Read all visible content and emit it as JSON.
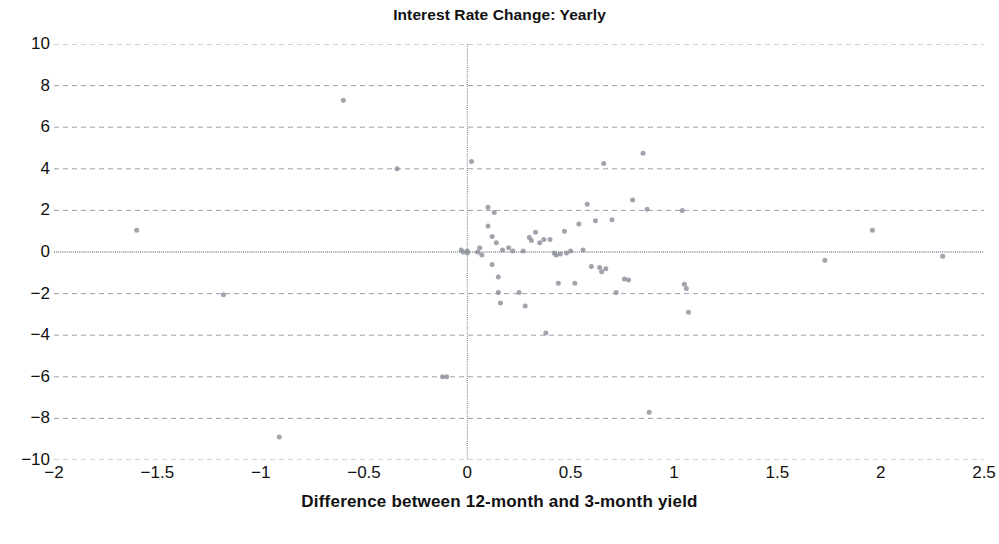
{
  "chart_data": {
    "type": "scatter",
    "title": "Interest Rate Change: Yearly",
    "xlabel": "Difference between 12-month and 3-month yield",
    "ylabel": "",
    "xlim": [
      -2,
      2.5
    ],
    "ylim": [
      -10,
      10
    ],
    "xticks": [
      -2,
      -1.5,
      -1,
      -0.5,
      0,
      0.5,
      1,
      1.5,
      2,
      2.5
    ],
    "xticklabels": [
      "−2",
      "−1.5",
      "−1",
      "−0.5",
      "0",
      "0.5",
      "1",
      "1.5",
      "2",
      "2.5"
    ],
    "yticks": [
      10,
      8,
      6,
      4,
      2,
      0,
      -2,
      -4,
      -6,
      -8,
      -10
    ],
    "yticklabels": [
      "10",
      "8",
      "6",
      "4",
      "2",
      "0",
      "−2",
      "−4",
      "−6",
      "−8",
      "−10"
    ],
    "grid": true,
    "grid_style": "dashed",
    "grid_color": "#9aa2b0",
    "zero_line_x": 0,
    "zero_line_y": 0,
    "marker": "circle",
    "marker_color": "#8c909a",
    "marker_size": 5,
    "legend": "none",
    "points": [
      [
        -1.6,
        1.05
      ],
      [
        -1.18,
        -2.05
      ],
      [
        -0.91,
        -8.9
      ],
      [
        -0.6,
        7.3
      ],
      [
        -0.34,
        4.0
      ],
      [
        -0.12,
        -6.0
      ],
      [
        -0.1,
        -6.0
      ],
      [
        -0.03,
        0.1
      ],
      [
        -0.02,
        0.0
      ],
      [
        0.0,
        0.05
      ],
      [
        0.0,
        -0.05
      ],
      [
        0.02,
        4.35
      ],
      [
        0.05,
        0.0
      ],
      [
        0.06,
        0.2
      ],
      [
        0.07,
        -0.15
      ],
      [
        0.1,
        2.15
      ],
      [
        0.1,
        1.25
      ],
      [
        0.12,
        0.75
      ],
      [
        0.12,
        -0.6
      ],
      [
        0.13,
        1.9
      ],
      [
        0.14,
        0.45
      ],
      [
        0.15,
        -1.2
      ],
      [
        0.15,
        -1.95
      ],
      [
        0.16,
        -2.45
      ],
      [
        0.17,
        0.1
      ],
      [
        0.2,
        0.2
      ],
      [
        0.22,
        0.05
      ],
      [
        0.25,
        -1.95
      ],
      [
        0.27,
        0.05
      ],
      [
        0.28,
        -2.6
      ],
      [
        0.3,
        0.7
      ],
      [
        0.31,
        0.55
      ],
      [
        0.33,
        0.95
      ],
      [
        0.35,
        0.45
      ],
      [
        0.37,
        0.6
      ],
      [
        0.38,
        -3.9
      ],
      [
        0.4,
        0.6
      ],
      [
        0.42,
        -0.05
      ],
      [
        0.43,
        -0.15
      ],
      [
        0.44,
        -1.5
      ],
      [
        0.45,
        -0.1
      ],
      [
        0.47,
        1.0
      ],
      [
        0.48,
        -0.05
      ],
      [
        0.5,
        0.05
      ],
      [
        0.52,
        -1.5
      ],
      [
        0.54,
        1.35
      ],
      [
        0.56,
        0.1
      ],
      [
        0.58,
        2.3
      ],
      [
        0.6,
        -0.7
      ],
      [
        0.62,
        1.5
      ],
      [
        0.64,
        -0.75
      ],
      [
        0.65,
        -0.95
      ],
      [
        0.66,
        4.25
      ],
      [
        0.67,
        -0.8
      ],
      [
        0.7,
        1.55
      ],
      [
        0.72,
        -1.95
      ],
      [
        0.76,
        -1.3
      ],
      [
        0.78,
        -1.35
      ],
      [
        0.8,
        2.5
      ],
      [
        0.85,
        4.75
      ],
      [
        0.87,
        2.05
      ],
      [
        0.88,
        -7.7
      ],
      [
        1.04,
        2.0
      ],
      [
        1.05,
        -1.55
      ],
      [
        1.06,
        -1.75
      ],
      [
        1.07,
        -2.9
      ],
      [
        1.73,
        -0.4
      ],
      [
        1.96,
        1.05
      ],
      [
        2.3,
        -0.2
      ]
    ]
  }
}
